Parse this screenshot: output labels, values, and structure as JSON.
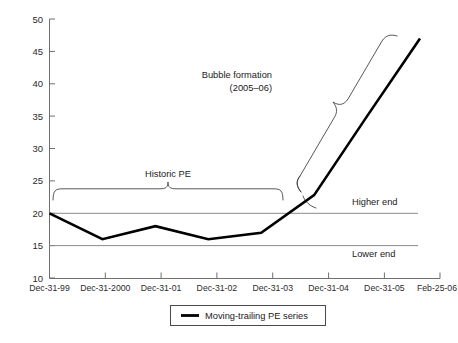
{
  "chart_data": {
    "type": "line",
    "title": "",
    "xlabel": "",
    "ylabel": "",
    "ylim": [
      10,
      50
    ],
    "yticks": [
      10,
      15,
      20,
      25,
      30,
      35,
      40,
      45,
      50
    ],
    "grid": false,
    "legend_position": "bottom-center",
    "categories": [
      "Dec-31-99",
      "Dec-31-2000",
      "Dec-31-01",
      "Dec-31-02",
      "Dec-31-03",
      "Dec-31-04",
      "Dec-31-05",
      "Feb-25-06"
    ],
    "series": [
      {
        "name": "Moving-trailing PE series",
        "values": [
          20.0,
          16.0,
          18.0,
          16.0,
          17.0,
          22.8,
          35.0,
          47.0
        ]
      }
    ],
    "reference_lines": [
      {
        "label": "Higher end",
        "value": 20.0
      },
      {
        "label": "Lower end",
        "value": 15.0
      }
    ],
    "annotations": [
      {
        "name": "historic-pe",
        "text": "Historic PE"
      },
      {
        "name": "bubble-formation-line1",
        "text": "Bubble formation"
      },
      {
        "name": "bubble-formation-line2",
        "text": "(2005–06)"
      }
    ]
  },
  "legend": {
    "entries": [
      {
        "label": "Moving-trailing PE series",
        "color": "#000000"
      }
    ]
  },
  "colors": {
    "series": "#000000",
    "axis": "#6f6f6f",
    "reference": "#8a8a8a",
    "brace": "#3a3a3a",
    "text": "#1a1a1a",
    "background": "#ffffff"
  }
}
